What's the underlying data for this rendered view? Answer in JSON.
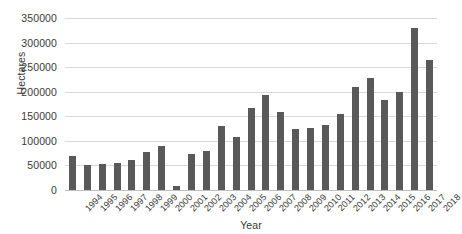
{
  "chart_data": {
    "type": "bar",
    "title": "",
    "xlabel": "Year",
    "ylabel": "Hectares",
    "ylim": [
      0,
      350000
    ],
    "ytick_step": 50000,
    "ytick_labels": [
      "350000",
      "300000",
      "250000",
      "200000",
      "150000",
      "100000",
      "50000",
      "0"
    ],
    "ytick_values": [
      350000,
      300000,
      250000,
      200000,
      150000,
      100000,
      50000,
      0
    ],
    "grid": true,
    "legend": false,
    "bar_color": "#595959",
    "gridline_color": "#d9d9d9",
    "background_color": "#ffffff",
    "categories": [
      "1994",
      "1995",
      "1996",
      "1997",
      "1998",
      "1999",
      "2000",
      "2001",
      "2002",
      "2003",
      "2004",
      "2005",
      "2006",
      "2007",
      "2008",
      "2009",
      "2010",
      "2011",
      "2012",
      "2013",
      "2014",
      "2015",
      "2016",
      "2017",
      "2018"
    ],
    "values": [
      70000,
      50000,
      53000,
      55000,
      62000,
      78000,
      90000,
      8000,
      73000,
      80000,
      131000,
      108000,
      166000,
      194000,
      158000,
      124000,
      127000,
      133000,
      154000,
      210000,
      227000,
      184000,
      200000,
      330000,
      265000
    ]
  }
}
